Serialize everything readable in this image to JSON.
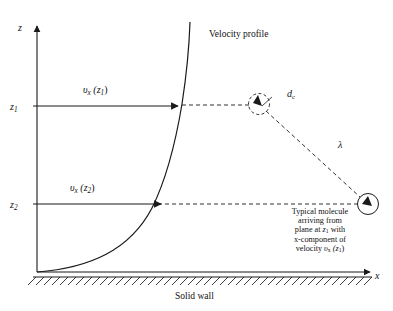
{
  "figure": {
    "type": "diagram",
    "title_text": "Velocity profile near a solid wall",
    "background_color": "#ffffff",
    "line_color": "#1a1a1a",
    "axes": {
      "vertical_label": "z",
      "horizontal_label": "x",
      "origin_x": 37,
      "origin_y": 272,
      "top_y": 22,
      "right_x": 372
    },
    "tick_labels": {
      "z1": "z",
      "z1_sub": "1",
      "z2": "z",
      "z2_sub": "2",
      "z1_y": 106,
      "z2_y": 204
    },
    "annotations": {
      "velocity_profile": "Velocity profile",
      "solid_wall": "Solid wall",
      "mean_free_path_symbol": "λ",
      "collision_diameter": "d",
      "collision_diameter_sub": "c"
    },
    "velocity_labels": {
      "upper": {
        "symbol": "υ",
        "sub": "x",
        "arg_open": " (z",
        "arg_sub": "1",
        "arg_close": ")"
      },
      "lower": {
        "symbol": "υ",
        "sub": "x",
        "arg_open": " (z",
        "arg_sub": "2",
        "arg_close": ")"
      }
    },
    "molecule_note": {
      "line1": "Typical molecule",
      "line2": "arriving from",
      "line3_a": "plane at ",
      "line3_z": "z",
      "line3_sub": "1",
      "line3_b": " with",
      "line4": "x-component of",
      "line5_a": "velocity ",
      "line5_v": "υ",
      "line5_vsub": "x",
      "line5_b": " (z",
      "line5_zsub": "1",
      "line5_c": ")"
    },
    "geometry": {
      "upper_arrow_y": 106,
      "upper_arrow_x_start": 37,
      "upper_arrow_x_end": 168,
      "lower_arrow_y": 204,
      "lower_arrow_x_start": 37,
      "lower_arrow_x_end": 155,
      "dashed_circle_center": [
        259,
        104
      ],
      "dashed_circle_radius": 11,
      "molecule_circle_center": [
        368,
        204
      ],
      "molecule_circle_radius": 11,
      "wall_hatch_count": 40,
      "wall_y": 277
    }
  }
}
